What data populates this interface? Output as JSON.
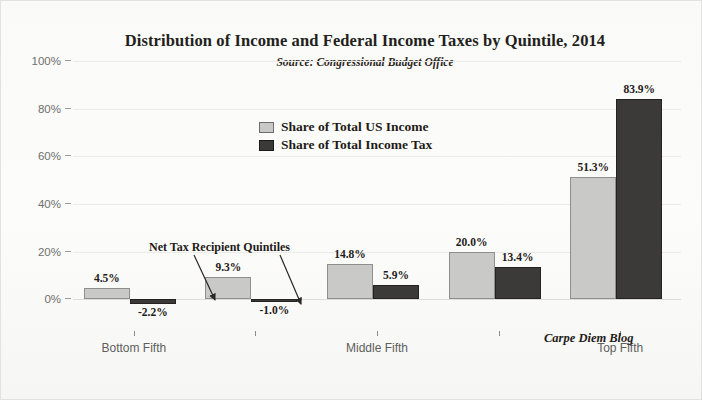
{
  "chart_data": {
    "type": "bar",
    "title": "Distribution of Income and Federal Income Taxes by Quintile, 2014",
    "subtitle": "Source: Congressional Budget Office",
    "xlabel": "",
    "ylabel": "",
    "ylim": [
      -10,
      100
    ],
    "grid": true,
    "legend_position": "upper-center",
    "categories": [
      "Bottom Fifth",
      "Second Fifth",
      "Middle Fifth",
      "Fourth Fifth",
      "Top Fifth"
    ],
    "visible_tick_labels": [
      "Bottom Fifth",
      "",
      "Middle Fifth",
      "",
      "Top Fifth"
    ],
    "ytick_labels": [
      "0%",
      "20%",
      "40%",
      "60%",
      "80%",
      "100%"
    ],
    "ytick_values": [
      0,
      20,
      40,
      60,
      80,
      100
    ],
    "series": [
      {
        "name": "Share of Total US Income",
        "color": "#c9c9c7",
        "values": [
          4.5,
          9.3,
          14.8,
          20.0,
          51.3
        ],
        "labels": [
          "4.5%",
          "9.3%",
          "14.8%",
          "20.0%",
          "51.3%"
        ]
      },
      {
        "name": "Share of Total Income Tax",
        "color": "#3c3a38",
        "values": [
          -2.2,
          -1.0,
          5.9,
          13.4,
          83.9
        ],
        "labels": [
          "-2.2%",
          "-1.0%",
          "5.9%",
          "13.4%",
          "83.9%"
        ]
      }
    ],
    "annotations": [
      {
        "text": "Net Tax Recipient Quintiles",
        "points_to": [
          "Bottom Fifth tax bar",
          "Second Fifth tax bar"
        ]
      },
      {
        "text": "Carpe Diem Blog",
        "role": "watermark"
      }
    ]
  }
}
